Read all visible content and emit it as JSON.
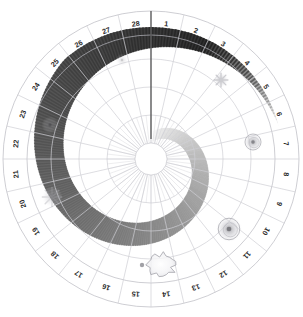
{
  "diagram": {
    "type": "polar-wheel",
    "sector_count": 28,
    "ring_count": 5,
    "center": {
      "x": 151,
      "y": 159
    },
    "radii": {
      "hub": 16,
      "ring1": 44,
      "ring2": 72,
      "ring3": 100,
      "ring4": 124,
      "label_inner": 124,
      "label_outer": 148
    },
    "colors": {
      "background": "#ffffff",
      "grid_line": "#cfcfd4",
      "outer_ring_line": "#b9b9c0",
      "label_text": "#2b2b2b",
      "pointer_line": "#3a3a3a",
      "arm_light": "#f2f2f2",
      "arm_mid": "#8f8f8f",
      "arm_dark": "#121212",
      "marker_stroke": "#9a9aa2",
      "hub_fill": "#ffffff"
    },
    "pointer": {
      "name": "north-pointer",
      "angle_deg": 0,
      "from_radius": 20,
      "to_radius": 148,
      "label": ""
    },
    "sector_labels": [
      "1",
      "2",
      "3",
      "4",
      "5",
      "6",
      "7",
      "8",
      "9",
      "10",
      "11",
      "12",
      "13",
      "14",
      "15",
      "16",
      "17",
      "18",
      "19",
      "20",
      "21",
      "22",
      "23",
      "24",
      "25",
      "26",
      "27",
      "28"
    ],
    "spiral_arm": {
      "name": "spiral-arm-density",
      "description": "Clockwise spiral band of grayscale density sweeping from the hub outward, darkest toward sectors 11-14",
      "start_angle_deg": 5,
      "sweep_deg": 430,
      "inner_radius": 18,
      "outer_radius": 132,
      "darkest_sector": "12"
    },
    "markers": [
      {
        "name": "galaxy-marker-faint-top",
        "sector": "28",
        "kind": "faint-spiral",
        "cx": 122,
        "cy": 60,
        "r": 6.5,
        "opacity": 0.3
      },
      {
        "name": "galaxy-marker-sector-4",
        "sector": "4",
        "kind": "spiral",
        "cx": 221,
        "cy": 80,
        "r": 7.5,
        "opacity": 0.62
      },
      {
        "name": "galaxy-marker-sector-7",
        "sector": "7",
        "kind": "ring-spiral",
        "cx": 253,
        "cy": 142,
        "r": 10.0,
        "opacity": 0.7
      },
      {
        "name": "galaxy-marker-sector-10",
        "sector": "10",
        "kind": "ring-spiral",
        "cx": 229,
        "cy": 229,
        "r": 13.5,
        "opacity": 0.78
      },
      {
        "name": "nebula-blob-sector-14",
        "sector": "14",
        "kind": "irregular-blob",
        "cx": 161,
        "cy": 265,
        "r": 14.0,
        "opacity": 0.8
      },
      {
        "name": "point-marker-sector-15",
        "sector": "15",
        "kind": "point",
        "cx": 142,
        "cy": 265,
        "r": 2.2,
        "opacity": 0.8
      },
      {
        "name": "galaxy-marker-sector-20",
        "sector": "20",
        "kind": "flower-spiral",
        "cx": 52,
        "cy": 197,
        "r": 10.5,
        "opacity": 0.45
      },
      {
        "name": "galaxy-marker-sector-23",
        "sector": "23",
        "kind": "faint-spiral",
        "cx": 50,
        "cy": 125,
        "r": 8.5,
        "opacity": 0.35
      }
    ]
  }
}
